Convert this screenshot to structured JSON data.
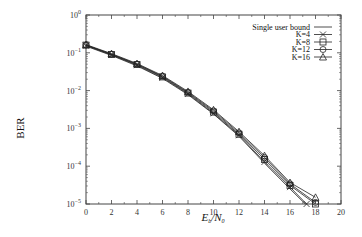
{
  "chart_data": {
    "type": "line",
    "title": "",
    "xlabel": "E_b / N_0",
    "ylabel": "BER",
    "xlim": [
      0,
      20
    ],
    "ylim": [
      1e-05,
      1
    ],
    "yscale": "log",
    "x_ticks": [
      "0",
      "2",
      "4",
      "6",
      "8",
      "10",
      "12",
      "14",
      "16",
      "18",
      "20"
    ],
    "y_ticks": [
      "10^0",
      "10^-1",
      "10^-2",
      "10^-3",
      "10^-4",
      "10^-5"
    ],
    "grid": false,
    "legend_position": "upper right",
    "series": [
      {
        "name": "Single user bound",
        "marker": "none",
        "x": [
          0,
          2,
          4,
          6,
          8,
          10,
          12,
          14,
          16,
          17.2
        ],
        "y": [
          0.15,
          0.085,
          0.045,
          0.021,
          0.0078,
          0.0024,
          0.00062,
          0.00012,
          2.5e-05,
          1e-05
        ]
      },
      {
        "name": "K=4",
        "marker": "x",
        "x": [
          0,
          2,
          4,
          6,
          8,
          10,
          12,
          14,
          16,
          17.3
        ],
        "y": [
          0.155,
          0.088,
          0.047,
          0.022,
          0.0082,
          0.0025,
          0.00066,
          0.00013,
          2.8e-05,
          1e-05
        ]
      },
      {
        "name": "K=8",
        "marker": "square",
        "x": [
          0,
          2,
          4,
          6,
          8,
          10,
          12,
          14,
          16,
          18
        ],
        "y": [
          0.16,
          0.09,
          0.049,
          0.023,
          0.0086,
          0.0027,
          0.0007,
          0.00015,
          3.1e-05,
          1e-05
        ]
      },
      {
        "name": "K=12",
        "marker": "circle",
        "x": [
          0,
          2,
          4,
          6,
          8,
          10,
          12,
          14,
          16,
          18
        ],
        "y": [
          0.16,
          0.092,
          0.05,
          0.024,
          0.009,
          0.0029,
          0.00076,
          0.00017,
          3.4e-05,
          1.1e-05
        ]
      },
      {
        "name": "K=16",
        "marker": "triangle",
        "x": [
          0,
          2,
          4,
          6,
          8,
          10,
          12,
          14,
          16,
          18
        ],
        "y": [
          0.165,
          0.095,
          0.052,
          0.025,
          0.0095,
          0.0031,
          0.00082,
          0.00019,
          3.7e-05,
          1.5e-05
        ]
      }
    ]
  },
  "labels": {
    "ylabel": "BER",
    "xlabel_main": "E",
    "xlabel_sub1": "b",
    "xlabel_slash": "/N",
    "xlabel_sub2": "0"
  }
}
